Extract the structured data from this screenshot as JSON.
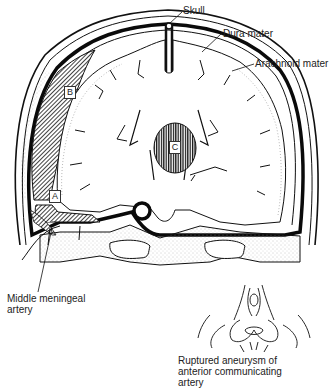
{
  "figure": {
    "labels": {
      "skull": "Skull",
      "dura": "Dura mater",
      "arachnoid": "Arachnoid mater",
      "mma_line1": "Middle meningeal",
      "mma_line2": "artery",
      "aneurysm_line1": "Ruptured aneurysm of",
      "aneurysm_line2": "anterior communicating",
      "aneurysm_line3": "artery"
    },
    "regions": {
      "a": "A",
      "b": "B",
      "c": "C"
    },
    "colors": {
      "ink": "#111111",
      "paper": "#ffffff",
      "stipple": "#999999"
    }
  }
}
